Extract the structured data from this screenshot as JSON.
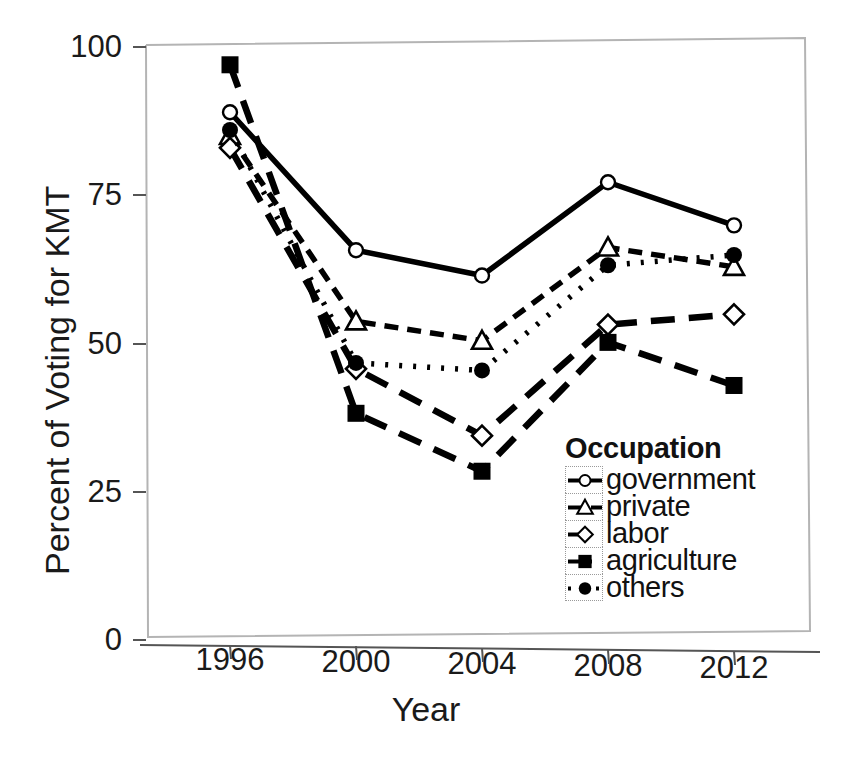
{
  "chart_data": {
    "type": "line",
    "title": "",
    "xlabel": "Year",
    "ylabel": "Percent of Voting for KMT",
    "categories": [
      "1996",
      "2000",
      "2004",
      "2008",
      "2012"
    ],
    "x": [
      1996,
      2000,
      2004,
      2008,
      2012
    ],
    "xlim": [
      1994,
      2014
    ],
    "ylim": [
      0,
      100
    ],
    "yticks": [
      0,
      25,
      50,
      75,
      100
    ],
    "ytick_labels": [
      "0",
      "25",
      "50",
      "75",
      "100"
    ],
    "xticks": [
      1996,
      2000,
      2004,
      2008,
      2012
    ],
    "xtick_labels": [
      "1996",
      "2000",
      "2004",
      "2008",
      "2012"
    ],
    "grid": false,
    "legend_position": "inside-lower-right",
    "legend_title": "Occupation",
    "series": [
      {
        "name": "government",
        "values": [
          89,
          66,
          62,
          78,
          71
        ],
        "marker": "open-circle",
        "line_style": "solid",
        "color": "#000000"
      },
      {
        "name": "private",
        "values": [
          85,
          54,
          51,
          67,
          64
        ],
        "marker": "open-triangle",
        "line_style": "dashed",
        "color": "#000000"
      },
      {
        "name": "labor",
        "values": [
          83,
          46,
          35,
          54,
          56
        ],
        "marker": "open-diamond",
        "line_style": "long-dash",
        "color": "#000000"
      },
      {
        "name": "agriculture",
        "values": [
          97,
          38.5,
          29,
          51,
          44
        ],
        "marker": "filled-square",
        "line_style": "long-dash",
        "color": "#000000"
      },
      {
        "name": "others",
        "values": [
          86,
          47,
          46,
          64,
          66
        ],
        "marker": "filled-circle",
        "line_style": "dotted",
        "color": "#000000"
      }
    ]
  },
  "axes": {
    "ylabel": "Percent of Voting for KMT",
    "xlabel": "Year",
    "ytick_labels": [
      "100",
      "75",
      "50",
      "25",
      "0"
    ],
    "xtick_labels": [
      "1996",
      "2000",
      "2004",
      "2008",
      "2012"
    ]
  },
  "legend": {
    "title": "Occupation",
    "items": [
      {
        "label": "government",
        "marker": "open-circle"
      },
      {
        "label": "private",
        "marker": "open-triangle"
      },
      {
        "label": "labor",
        "marker": "open-diamond"
      },
      {
        "label": "agriculture",
        "marker": "filled-square"
      },
      {
        "label": "others",
        "marker": "filled-circle"
      }
    ]
  },
  "colors": {
    "ink": "#000000",
    "frame": "#b4b4b4",
    "text": "#1a1a1a"
  }
}
